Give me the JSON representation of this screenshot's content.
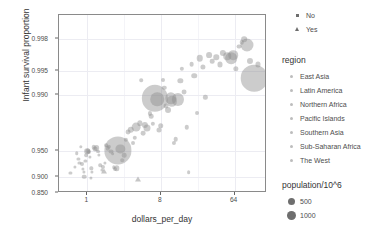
{
  "chart_data": {
    "type": "scatter",
    "title": "",
    "xlabel": "dollars_per_day",
    "ylabel": "Infant survival proportion",
    "x_scale": "log2",
    "x_ticks": [
      1,
      8,
      64
    ],
    "x_tick_labels": [
      "1",
      "8",
      "64"
    ],
    "y_scale": "logit-like",
    "y_ticks": [
      0.998,
      0.995,
      0.99,
      0.95,
      0.9,
      0.85
    ],
    "y_tick_labels": [
      "0.998",
      "0.995",
      "0.990",
      "0.950",
      "0.900",
      "0.850"
    ],
    "xlim": [
      0.45,
      160
    ],
    "ylim": [
      0.85,
      0.999
    ],
    "grid": true,
    "legend_position": "right",
    "point_color": "#8d8d8d",
    "panel_border_color": "#8a8a8a",
    "grid_color": "#ececf2",
    "series": [
      {
        "name": "points",
        "points": [
          {
            "x": 0.62,
            "y": 0.9105,
            "pop": 12,
            "shape": "circle"
          },
          {
            "x": 0.7,
            "y": 0.923,
            "pop": 10,
            "shape": "circle"
          },
          {
            "x": 0.74,
            "y": 0.9475,
            "pop": 18,
            "shape": "circle"
          },
          {
            "x": 0.78,
            "y": 0.939,
            "pop": 14,
            "shape": "circle"
          },
          {
            "x": 0.8,
            "y": 0.9318,
            "pop": 11,
            "shape": "circle"
          },
          {
            "x": 0.83,
            "y": 0.956,
            "pop": 16,
            "shape": "circle"
          },
          {
            "x": 0.86,
            "y": 0.9288,
            "pop": 22,
            "shape": "circle"
          },
          {
            "x": 0.88,
            "y": 0.9188,
            "pop": 13,
            "shape": "circle"
          },
          {
            "x": 0.9,
            "y": 0.9122,
            "pop": 9,
            "shape": "circle"
          },
          {
            "x": 0.92,
            "y": 0.901,
            "pop": 30,
            "shape": "circle"
          },
          {
            "x": 0.95,
            "y": 0.9352,
            "pop": 12,
            "shape": "circle"
          },
          {
            "x": 0.97,
            "y": 0.944,
            "pop": 20,
            "shape": "circle"
          },
          {
            "x": 1.0,
            "y": 0.95,
            "pop": 45,
            "shape": "circle"
          },
          {
            "x": 1.02,
            "y": 0.9505,
            "pop": 38,
            "shape": "circle"
          },
          {
            "x": 1.05,
            "y": 0.9488,
            "pop": 25,
            "shape": "circle"
          },
          {
            "x": 1.08,
            "y": 0.9412,
            "pop": 14,
            "shape": "circle"
          },
          {
            "x": 1.1,
            "y": 0.8985,
            "pop": 11,
            "shape": "circle"
          },
          {
            "x": 1.12,
            "y": 0.9205,
            "pop": 16,
            "shape": "circle"
          },
          {
            "x": 1.15,
            "y": 0.9135,
            "pop": 10,
            "shape": "circle"
          },
          {
            "x": 1.2,
            "y": 0.9555,
            "pop": 28,
            "shape": "circle"
          },
          {
            "x": 1.26,
            "y": 0.953,
            "pop": 34,
            "shape": "circle"
          },
          {
            "x": 1.3,
            "y": 0.9545,
            "pop": 48,
            "shape": "circle"
          },
          {
            "x": 1.34,
            "y": 0.9498,
            "pop": 22,
            "shape": "circle"
          },
          {
            "x": 1.4,
            "y": 0.9452,
            "pop": 15,
            "shape": "circle"
          },
          {
            "x": 1.45,
            "y": 0.9265,
            "pop": 18,
            "shape": "circle"
          },
          {
            "x": 1.5,
            "y": 0.918,
            "pop": 13,
            "shape": "circle"
          },
          {
            "x": 1.55,
            "y": 0.9228,
            "pop": 24,
            "shape": "circle"
          },
          {
            "x": 1.6,
            "y": 0.9158,
            "pop": 17,
            "shape": "triangle"
          },
          {
            "x": 1.65,
            "y": 0.9318,
            "pop": 12,
            "shape": "circle"
          },
          {
            "x": 1.7,
            "y": 0.9578,
            "pop": 20,
            "shape": "circle"
          },
          {
            "x": 1.78,
            "y": 0.9542,
            "pop": 30,
            "shape": "circle"
          },
          {
            "x": 1.85,
            "y": 0.9562,
            "pop": 26,
            "shape": "circle"
          },
          {
            "x": 1.95,
            "y": 0.9498,
            "pop": 35,
            "shape": "circle"
          },
          {
            "x": 2.05,
            "y": 0.9468,
            "pop": 20,
            "shape": "circle"
          },
          {
            "x": 2.1,
            "y": 0.9228,
            "pop": 16,
            "shape": "circle"
          },
          {
            "x": 2.2,
            "y": 0.9188,
            "pop": 22,
            "shape": "circle"
          },
          {
            "x": 2.3,
            "y": 0.9205,
            "pop": 42,
            "shape": "circle"
          },
          {
            "x": 2.4,
            "y": 0.9512,
            "pop": 1050,
            "shape": "circle"
          },
          {
            "x": 2.55,
            "y": 0.9535,
            "pop": 120,
            "shape": "circle"
          },
          {
            "x": 2.7,
            "y": 0.9362,
            "pop": 18,
            "shape": "circle"
          },
          {
            "x": 2.85,
            "y": 0.9442,
            "pop": 30,
            "shape": "circle"
          },
          {
            "x": 3.0,
            "y": 0.9638,
            "pop": 26,
            "shape": "circle"
          },
          {
            "x": 3.2,
            "y": 0.9708,
            "pop": 34,
            "shape": "circle"
          },
          {
            "x": 3.4,
            "y": 0.9728,
            "pop": 60,
            "shape": "circle"
          },
          {
            "x": 3.6,
            "y": 0.9605,
            "pop": 22,
            "shape": "circle"
          },
          {
            "x": 3.8,
            "y": 0.9658,
            "pop": 28,
            "shape": "circle"
          },
          {
            "x": 4.0,
            "y": 0.9745,
            "pop": 110,
            "shape": "circle"
          },
          {
            "x": 4.2,
            "y": 0.8955,
            "pop": 20,
            "shape": "triangle"
          },
          {
            "x": 4.4,
            "y": 0.9772,
            "pop": 40,
            "shape": "circle"
          },
          {
            "x": 4.6,
            "y": 0.9934,
            "pop": 18,
            "shape": "circle"
          },
          {
            "x": 4.8,
            "y": 0.97,
            "pop": 32,
            "shape": "circle"
          },
          {
            "x": 5.1,
            "y": 0.9762,
            "pop": 55,
            "shape": "circle"
          },
          {
            "x": 5.4,
            "y": 0.9742,
            "pop": 70,
            "shape": "circle"
          },
          {
            "x": 5.8,
            "y": 0.9828,
            "pop": 24,
            "shape": "circle"
          },
          {
            "x": 6.1,
            "y": 0.9815,
            "pop": 30,
            "shape": "circle"
          },
          {
            "x": 6.4,
            "y": 0.9768,
            "pop": 26,
            "shape": "circle"
          },
          {
            "x": 6.8,
            "y": 0.9888,
            "pop": 980,
            "shape": "circle"
          },
          {
            "x": 7.2,
            "y": 0.9885,
            "pop": 260,
            "shape": "circle"
          },
          {
            "x": 7.6,
            "y": 0.9725,
            "pop": 36,
            "shape": "circle"
          },
          {
            "x": 8.0,
            "y": 0.9755,
            "pop": 44,
            "shape": "circle"
          },
          {
            "x": 8.4,
            "y": 0.9935,
            "pop": 22,
            "shape": "circle"
          },
          {
            "x": 8.8,
            "y": 0.9918,
            "pop": 28,
            "shape": "circle"
          },
          {
            "x": 9.2,
            "y": 0.9862,
            "pop": 34,
            "shape": "circle"
          },
          {
            "x": 9.8,
            "y": 0.9845,
            "pop": 50,
            "shape": "circle"
          },
          {
            "x": 10.5,
            "y": 0.9888,
            "pop": 180,
            "shape": "circle"
          },
          {
            "x": 11.0,
            "y": 0.9878,
            "pop": 150,
            "shape": "circle"
          },
          {
            "x": 11.6,
            "y": 0.9608,
            "pop": 24,
            "shape": "circle"
          },
          {
            "x": 12.2,
            "y": 0.9642,
            "pop": 30,
            "shape": "circle"
          },
          {
            "x": 13.0,
            "y": 0.9885,
            "pop": 210,
            "shape": "circle"
          },
          {
            "x": 13.8,
            "y": 0.9932,
            "pop": 40,
            "shape": "circle"
          },
          {
            "x": 14.5,
            "y": 0.9952,
            "pop": 26,
            "shape": "circle"
          },
          {
            "x": 15.5,
            "y": 0.9908,
            "pop": 34,
            "shape": "circle"
          },
          {
            "x": 16.5,
            "y": 0.9745,
            "pop": 28,
            "shape": "circle"
          },
          {
            "x": 17.5,
            "y": 0.9128,
            "pop": 20,
            "shape": "circle"
          },
          {
            "x": 19.0,
            "y": 0.9958,
            "pop": 32,
            "shape": "circle"
          },
          {
            "x": 20.5,
            "y": 0.9942,
            "pop": 44,
            "shape": "circle"
          },
          {
            "x": 22.0,
            "y": 0.9828,
            "pop": 22,
            "shape": "circle"
          },
          {
            "x": 24.0,
            "y": 0.9965,
            "pop": 60,
            "shape": "circle"
          },
          {
            "x": 26.0,
            "y": 0.9955,
            "pop": 38,
            "shape": "circle"
          },
          {
            "x": 28.0,
            "y": 0.9892,
            "pop": 26,
            "shape": "circle"
          },
          {
            "x": 31.0,
            "y": 0.9968,
            "pop": 48,
            "shape": "circle"
          },
          {
            "x": 34.0,
            "y": 0.9962,
            "pop": 30,
            "shape": "circle"
          },
          {
            "x": 38.0,
            "y": 0.9966,
            "pop": 42,
            "shape": "circle"
          },
          {
            "x": 42.0,
            "y": 0.9958,
            "pop": 36,
            "shape": "circle"
          },
          {
            "x": 46.0,
            "y": 0.997,
            "pop": 55,
            "shape": "circle"
          },
          {
            "x": 52.0,
            "y": 0.9967,
            "pop": 80,
            "shape": "circle"
          },
          {
            "x": 58.0,
            "y": 0.9965,
            "pop": 190,
            "shape": "circle"
          },
          {
            "x": 62.0,
            "y": 0.9968,
            "pop": 130,
            "shape": "circle"
          },
          {
            "x": 66.0,
            "y": 0.9952,
            "pop": 40,
            "shape": "circle"
          },
          {
            "x": 72.0,
            "y": 0.9975,
            "pop": 34,
            "shape": "circle"
          },
          {
            "x": 78.0,
            "y": 0.9978,
            "pop": 28,
            "shape": "circle"
          },
          {
            "x": 84.0,
            "y": 0.998,
            "pop": 46,
            "shape": "circle"
          },
          {
            "x": 92.0,
            "y": 0.9976,
            "pop": 240,
            "shape": "circle"
          },
          {
            "x": 100.0,
            "y": 0.9962,
            "pop": 52,
            "shape": "circle"
          },
          {
            "x": 112.0,
            "y": 0.9938,
            "pop": 1000,
            "shape": "circle"
          },
          {
            "x": 124.0,
            "y": 0.9958,
            "pop": 36,
            "shape": "circle"
          }
        ]
      }
    ]
  },
  "axis": {
    "y_title": "Infant survival proportion",
    "x_title": "dollars_per_day"
  },
  "legends": {
    "shape_legend": {
      "title": "",
      "items": [
        {
          "label": "No",
          "marker": "square-dot"
        },
        {
          "label": "Yes",
          "marker": "triangle"
        }
      ]
    },
    "region_legend": {
      "title": "region",
      "items": [
        {
          "label": "East Asia"
        },
        {
          "label": "Latin America"
        },
        {
          "label": "Northern Africa"
        },
        {
          "label": "Pacific Islands"
        },
        {
          "label": "Southern Asia"
        },
        {
          "label": "Sub-Saharan Africa"
        },
        {
          "label": "The West"
        }
      ]
    },
    "population_legend": {
      "title": "population/10^6",
      "items": [
        {
          "label": "500",
          "size": 7
        },
        {
          "label": "1000",
          "size": 9
        }
      ]
    }
  }
}
